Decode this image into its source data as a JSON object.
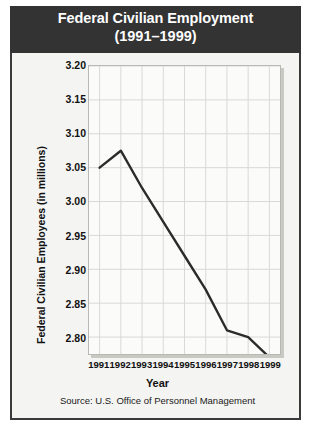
{
  "header": {
    "title": "Federal Civilian Employment",
    "subtitle": "(1991–1999)"
  },
  "source": "Source: U.S. Office of Personnel Management",
  "chart_data": {
    "type": "line",
    "title": "Federal Civilian Employment",
    "subtitle": "(1991–1999)",
    "xlabel": "Year",
    "ylabel": "Federal Civilian Employees (in millions)",
    "categories": [
      "1991",
      "1992",
      "1993",
      "1994",
      "1995",
      "1996",
      "1997",
      "1998",
      "1999"
    ],
    "x": [
      1991,
      1992,
      1993,
      1994,
      1995,
      1996,
      1997,
      1998,
      1999
    ],
    "values": [
      3.05,
      3.075,
      3.02,
      2.97,
      2.92,
      2.87,
      2.81,
      2.8,
      2.77
    ],
    "ylim": [
      2.775,
      3.2
    ],
    "yticks": [
      "3.20",
      "3.15",
      "3.10",
      "3.05",
      "3.00",
      "2.95",
      "2.90",
      "2.85",
      "2.80"
    ],
    "ytick_values": [
      3.2,
      3.15,
      3.1,
      3.05,
      3.0,
      2.95,
      2.9,
      2.85,
      2.8
    ],
    "grid": true,
    "legend": false,
    "line_color": "#2b2b2b",
    "plot_background": "#fbfbfa",
    "header_background": "#333333",
    "panel_background": "#f4f4f2"
  }
}
